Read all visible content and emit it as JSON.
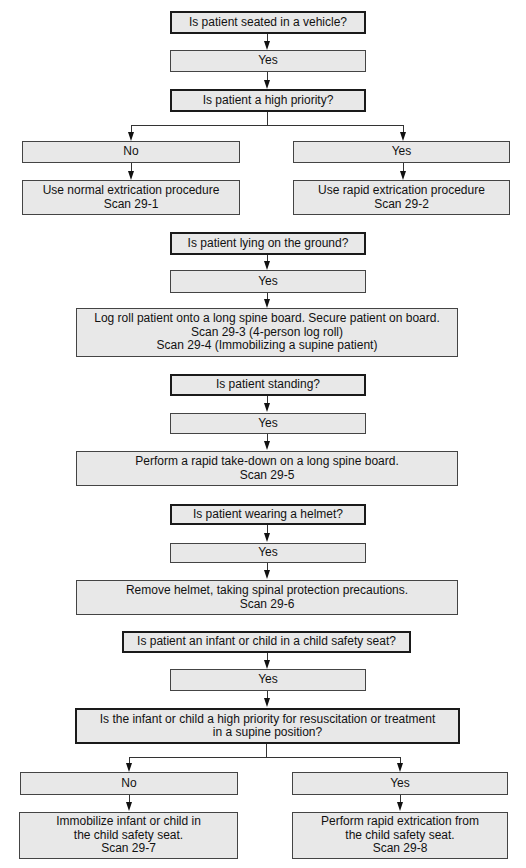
{
  "flowchart": {
    "q_vehicle": "Is patient seated in a vehicle?",
    "vehicle_yes": "Yes",
    "q_priority": "Is patient a high priority?",
    "priority_no": "No",
    "priority_yes": "Yes",
    "normal_extrication": [
      "Use normal extrication procedure",
      "Scan 29-1"
    ],
    "rapid_extrication": [
      "Use rapid extrication procedure",
      "Scan 29-2"
    ],
    "q_lying": "Is patient lying on the ground?",
    "lying_yes": "Yes",
    "log_roll": [
      "Log roll patient onto a long spine board. Secure patient on board.",
      "Scan 29-3 (4-person log roll)",
      "Scan 29-4 (Immobilizing a supine patient)"
    ],
    "q_standing": "Is patient standing?",
    "standing_yes": "Yes",
    "take_down": [
      "Perform a rapid take-down on a long spine board.",
      "Scan 29-5"
    ],
    "q_helmet": "Is patient wearing a helmet?",
    "helmet_yes": "Yes",
    "remove_helmet": [
      "Remove helmet, taking spinal protection precautions.",
      "Scan 29-6"
    ],
    "q_child_seat": "Is patient an infant or child in a child safety seat?",
    "child_seat_yes": "Yes",
    "q_child_priority": [
      "Is the infant or child a high priority for resuscitation or treatment",
      "in a supine position?"
    ],
    "child_priority_no": "No",
    "child_priority_yes": "Yes",
    "immobilize_in_seat": [
      "Immobilize infant or child in",
      "the child safety seat.",
      "Scan 29-7"
    ],
    "rapid_from_seat": [
      "Perform rapid extrication from",
      "the child safety seat.",
      "Scan 29-8"
    ]
  }
}
